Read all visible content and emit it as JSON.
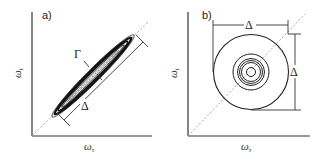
{
  "figure": {
    "panels": [
      {
        "id": "a",
        "label": "a)",
        "xlabel": "ω",
        "xlabel_sub": "τ",
        "ylabel": "ω",
        "ylabel_sub": "t",
        "annotations": {
          "gamma": "Γ",
          "delta": "Δ"
        },
        "description": "Narrow elongated elliptical contours along the diagonal (inhomogeneous broadening)"
      },
      {
        "id": "b",
        "label": "b)",
        "xlabel": "ω",
        "xlabel_sub": "τ",
        "ylabel": "ω",
        "ylabel_sub": "t",
        "annotations": {
          "delta_horizontal": "Δ",
          "delta_vertical": "Δ"
        },
        "description": "Concentric circular contours centered on the diagonal (homogeneous broadening)"
      }
    ],
    "colors": {
      "line": "#2a2a2a",
      "diagonal": "#9a9a9a",
      "contour": "#111111",
      "background": "#ffffff"
    }
  }
}
